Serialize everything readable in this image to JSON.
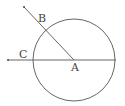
{
  "diagram": {
    "circle": {
      "cx": 74,
      "cy": 60,
      "r": 41,
      "stroke": "#555555"
    },
    "center_point": {
      "label": "A",
      "x": 74,
      "y": 60
    },
    "ray_b": {
      "label": "B",
      "from": [
        74,
        60
      ],
      "to": [
        24,
        7
      ]
    },
    "line_c": {
      "label": "C",
      "from": [
        116,
        60
      ],
      "to": [
        8,
        60
      ]
    },
    "labels": {
      "A": "A",
      "B": "B",
      "C": "C"
    }
  }
}
